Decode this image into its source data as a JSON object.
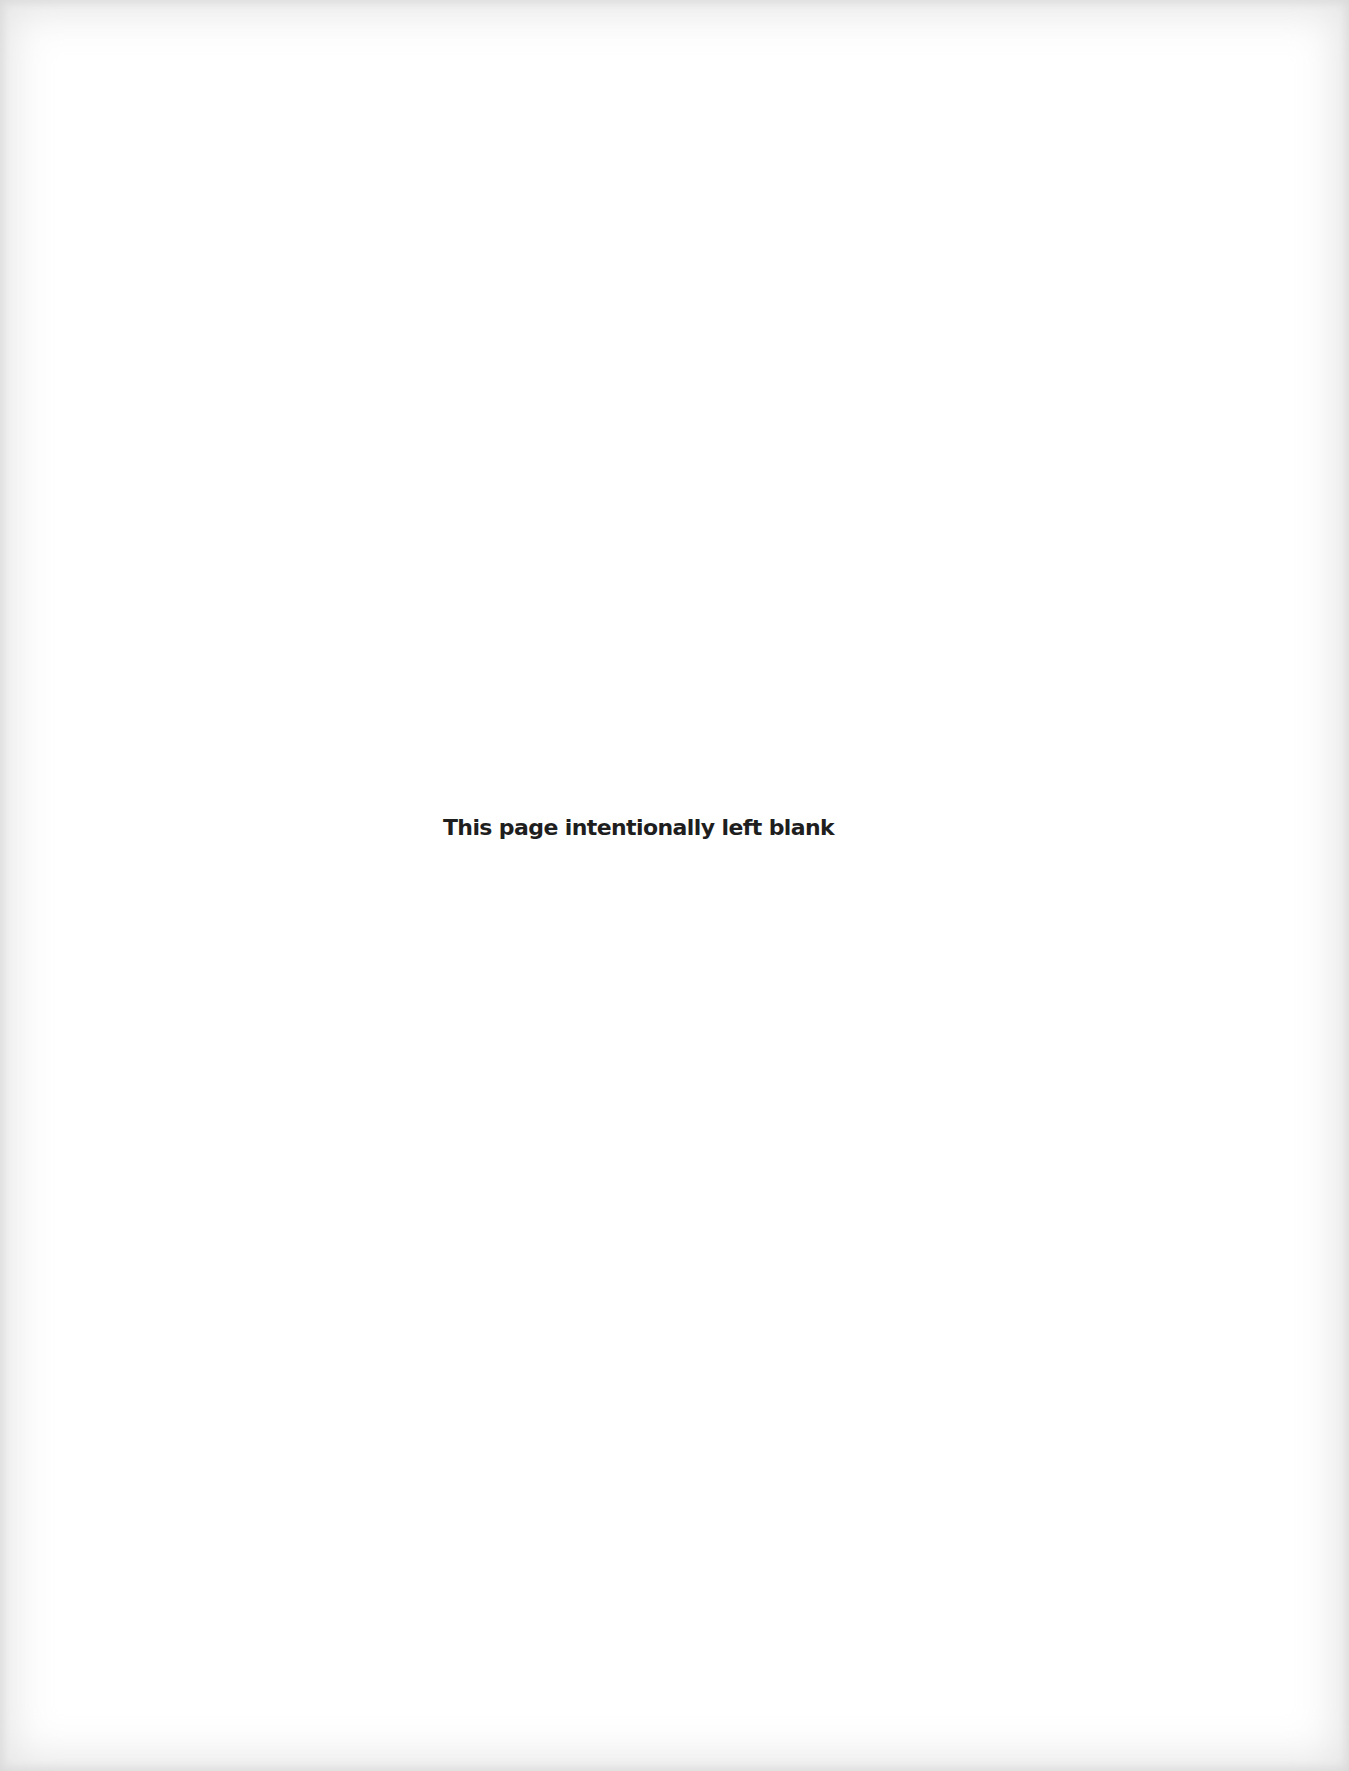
{
  "page": {
    "notice": "This page intentionally left blank",
    "background_color": "#ffffff",
    "text_color": "#1e1e1e"
  }
}
